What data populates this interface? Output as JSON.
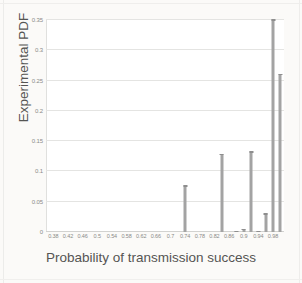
{
  "chart_data": {
    "type": "bar",
    "title": "",
    "xlabel": "Probability of transmission success",
    "ylabel": "Experimental PDF",
    "xlim": [
      0.36,
      1.01
    ],
    "ylim": [
      0,
      0.35
    ],
    "grid": true,
    "legend": false,
    "bar_color": "#a3a3a3",
    "xticks": [
      "0.38",
      "0.42",
      "0.46",
      "0.5",
      "0.54",
      "0.58",
      "0.62",
      "0.66",
      "0.7",
      "0.74",
      "0.78",
      "0.82",
      "0.86",
      "0.9",
      "0.94",
      "0.98"
    ],
    "xtick_values": [
      0.38,
      0.42,
      0.46,
      0.5,
      0.54,
      0.58,
      0.62,
      0.66,
      0.7,
      0.74,
      0.78,
      0.82,
      0.86,
      0.9,
      0.94,
      0.98
    ],
    "yticks": [
      "0",
      "0.05",
      "0.1",
      "0.15",
      "0.2",
      "0.25",
      "0.3",
      "0.35"
    ],
    "ytick_values": [
      0,
      0.05,
      0.1,
      0.15,
      0.2,
      0.25,
      0.3,
      0.35
    ],
    "x": [
      0.74,
      0.84,
      0.88,
      0.9,
      0.92,
      0.94,
      0.96,
      0.98,
      1.0
    ],
    "values": [
      0.077,
      0.129,
      0.002,
      0.005,
      0.133,
      0.002,
      0.031,
      0.351,
      0.261
    ]
  }
}
